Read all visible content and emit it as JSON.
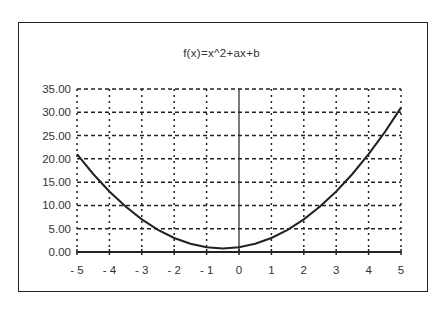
{
  "chart_data": {
    "type": "line",
    "title": "f(x)=x^2+ax+b",
    "xlabel": "",
    "ylabel": "",
    "x_ticks": [
      "- 5",
      "- 4",
      "- 3",
      "- 2",
      "- 1",
      "0",
      "1",
      "2",
      "3",
      "4",
      "5"
    ],
    "y_ticks": [
      "0.00",
      "5.00",
      "10.00",
      "15.00",
      "20.00",
      "25.00",
      "30.00",
      "35.00"
    ],
    "xlim": [
      -5,
      5
    ],
    "ylim": [
      0,
      35
    ],
    "grid": true,
    "legend": null,
    "series": [
      {
        "name": "f(x)",
        "x": [
          -5,
          -4.5,
          -4,
          -3.5,
          -3,
          -2.5,
          -2,
          -1.5,
          -1,
          -0.5,
          0,
          0.5,
          1,
          1.5,
          2,
          2.5,
          3,
          3.5,
          4,
          4.5,
          5
        ],
        "values": [
          21,
          16.75,
          13,
          9.75,
          7,
          4.75,
          3,
          1.75,
          1,
          0.75,
          1,
          1.75,
          3,
          4.75,
          7,
          9.75,
          13,
          16.75,
          21,
          25.75,
          31
        ]
      }
    ]
  }
}
